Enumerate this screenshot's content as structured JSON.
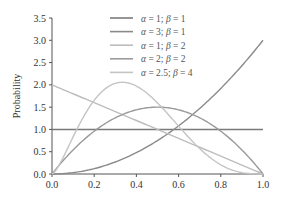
{
  "chart_data": {
    "type": "line",
    "title": "",
    "xlabel": "",
    "ylabel": "Probability",
    "xlim": [
      0.0,
      1.0
    ],
    "ylim": [
      0.0,
      3.5
    ],
    "xticks": [
      "0.0",
      "0.2",
      "0.4",
      "0.6",
      "0.8",
      "1.0"
    ],
    "yticks": [
      "0.0",
      "0.5",
      "1.0",
      "1.5",
      "2.0",
      "2.5",
      "3.0",
      "3.5"
    ],
    "grid": false,
    "legend_position": "upper center",
    "x": [
      0.0,
      0.1,
      0.2,
      0.3,
      0.4,
      0.5,
      0.6,
      0.7,
      0.8,
      0.9,
      1.0
    ],
    "series": [
      {
        "name": "α = 1; β = 1",
        "alpha": 1,
        "beta": 1,
        "color": "#7a7a7a",
        "values": [
          1.0,
          1.0,
          1.0,
          1.0,
          1.0,
          1.0,
          1.0,
          1.0,
          1.0,
          1.0,
          1.0
        ]
      },
      {
        "name": "α = 3; β = 1",
        "alpha": 3,
        "beta": 1,
        "color": "#8a8a8a",
        "values": [
          0.0,
          0.03,
          0.12,
          0.27,
          0.48,
          0.75,
          1.08,
          1.47,
          1.92,
          2.43,
          3.0
        ]
      },
      {
        "name": "α = 1; β = 2",
        "alpha": 1,
        "beta": 2,
        "color": "#bdbdbd",
        "values": [
          2.0,
          1.8,
          1.6,
          1.4,
          1.2,
          1.0,
          0.8,
          0.6,
          0.4,
          0.2,
          0.0
        ]
      },
      {
        "name": "α = 2; β = 2",
        "alpha": 2,
        "beta": 2,
        "color": "#9a9a9a",
        "values": [
          0.0,
          0.54,
          0.96,
          1.26,
          1.44,
          1.5,
          1.44,
          1.26,
          0.96,
          0.54,
          0.0
        ]
      },
      {
        "name": "α = 2.5; β = 4",
        "alpha": 2.5,
        "beta": 4,
        "color": "#c4c4c4",
        "values": [
          0.0,
          0.83,
          1.65,
          2.03,
          1.98,
          1.6,
          1.05,
          0.51,
          0.16,
          0.02,
          0.0
        ]
      }
    ]
  },
  "legend": {
    "items": [
      {
        "a": "α",
        "eq1": " = 1; ",
        "b": "β",
        "eq2": " = 1"
      },
      {
        "a": "α",
        "eq1": " = 3; ",
        "b": "β",
        "eq2": " = 1"
      },
      {
        "a": "α",
        "eq1": " = 1; ",
        "b": "β",
        "eq2": " = 2"
      },
      {
        "a": "α",
        "eq1": " = 2; ",
        "b": "β",
        "eq2": " = 2"
      },
      {
        "a": "α",
        "eq1": " = 2.5; ",
        "b": "β",
        "eq2": " = 4"
      }
    ]
  }
}
